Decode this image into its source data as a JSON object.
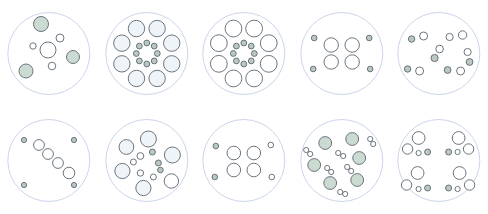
{
  "figure": {
    "rows": 2,
    "columns": 5,
    "background_color": "#ffffff"
  },
  "styles": {
    "enclosure_stroke": "#c5cfe8",
    "enclosure_fill": "#ffffff",
    "enclosure_stroke_width": 0.9,
    "dot_stroke": "#5c6670",
    "dot_stroke_width": 0.9,
    "fill_white": "#ffffff",
    "fill_green": "#ccdbd2",
    "fill_pale_blue": "#eef4f7",
    "fill_gray_green": "#b9c9c2"
  },
  "panels": [
    {
      "id": "panel-1",
      "name": "scattered-mixed-sizes-green-accents",
      "row": 1,
      "column": 1,
      "enclosure": {
        "cx": 48.8,
        "cy": 53.5,
        "r": 41
      },
      "circle_count": 7,
      "circles": [
        {
          "cx": 41,
          "cy": 24,
          "r": 7.5,
          "fill": "green"
        },
        {
          "cx": 26,
          "cy": 71,
          "r": 7.0,
          "fill": "green"
        },
        {
          "cx": 73,
          "cy": 57,
          "r": 6.5,
          "fill": "green"
        },
        {
          "cx": 48,
          "cy": 50,
          "r": 8.0,
          "fill": "white"
        },
        {
          "cx": 60,
          "cy": 38,
          "r": 4.0,
          "fill": "white"
        },
        {
          "cx": 33,
          "cy": 46,
          "r": 3.2,
          "fill": "white"
        },
        {
          "cx": 52,
          "cy": 66,
          "r": 3.8,
          "fill": "white"
        }
      ]
    },
    {
      "id": "panel-2",
      "name": "ebbinghaus-ring-large-outer",
      "row": 1,
      "column": 2,
      "enclosure": {
        "cx": 146.4,
        "cy": 53.5,
        "r": 41
      },
      "circle_count": 16,
      "outer_ring": {
        "count": 8,
        "radius": 27,
        "dot_r": 8.2,
        "fill": "pale_blue"
      },
      "inner_ring": {
        "count": 8,
        "radius": 10.5,
        "dot_r": 2.9,
        "fill": "gray_green"
      }
    },
    {
      "id": "panel-3",
      "name": "ebbinghaus-ring-large-outer-variant",
      "row": 1,
      "column": 3,
      "enclosure": {
        "cx": 244,
        "cy": 53.5,
        "r": 41
      },
      "circle_count": 16,
      "outer_ring": {
        "count": 8,
        "radius": 27,
        "dot_r": 8.4,
        "fill": "white"
      },
      "inner_ring": {
        "count": 8,
        "radius": 10.5,
        "dot_r": 2.9,
        "fill": "gray_green"
      }
    },
    {
      "id": "panel-4",
      "name": "four-medium-cluster-with-corner-dots",
      "row": 1,
      "column": 4,
      "enclosure": {
        "cx": 341.6,
        "cy": 53.5,
        "r": 41
      },
      "circle_count": 8,
      "circles": [
        {
          "cx": 331,
          "cy": 45,
          "r": 7.2,
          "fill": "white"
        },
        {
          "cx": 331,
          "cy": 62,
          "r": 7.2,
          "fill": "white"
        },
        {
          "cx": 352,
          "cy": 45,
          "r": 7.2,
          "fill": "white"
        },
        {
          "cx": 352,
          "cy": 62,
          "r": 7.2,
          "fill": "white"
        },
        {
          "cx": 314,
          "cy": 38,
          "r": 2.8,
          "fill": "gray_green"
        },
        {
          "cx": 313,
          "cy": 69,
          "r": 2.8,
          "fill": "gray_green"
        },
        {
          "cx": 369,
          "cy": 38,
          "r": 2.8,
          "fill": "gray_green"
        },
        {
          "cx": 370,
          "cy": 69,
          "r": 2.8,
          "fill": "gray_green"
        }
      ]
    },
    {
      "id": "panel-5",
      "name": "scattered-small-dots-ring",
      "row": 1,
      "column": 5,
      "enclosure": {
        "cx": 439.2,
        "cy": 53.5,
        "r": 41
      },
      "circle_count": 12,
      "circles": [
        {
          "cx": 412,
          "cy": 39,
          "r": 3.2,
          "fill": "gray_green"
        },
        {
          "cx": 424,
          "cy": 36,
          "r": 4.0,
          "fill": "white"
        },
        {
          "cx": 450,
          "cy": 37,
          "r": 3.6,
          "fill": "white"
        },
        {
          "cx": 463,
          "cy": 35,
          "r": 4.2,
          "fill": "white"
        },
        {
          "cx": 440,
          "cy": 49,
          "r": 3.8,
          "fill": "white"
        },
        {
          "cx": 435,
          "cy": 58,
          "r": 3.6,
          "fill": "gray_green"
        },
        {
          "cx": 468,
          "cy": 52,
          "r": 3.6,
          "fill": "white"
        },
        {
          "cx": 470,
          "cy": 62,
          "r": 3.4,
          "fill": "gray_green"
        },
        {
          "cx": 408,
          "cy": 69,
          "r": 3.2,
          "fill": "gray_green"
        },
        {
          "cx": 420,
          "cy": 71,
          "r": 4.0,
          "fill": "white"
        },
        {
          "cx": 448,
          "cy": 70,
          "r": 3.4,
          "fill": "gray_green"
        },
        {
          "cx": 461,
          "cy": 71,
          "r": 4.0,
          "fill": "white"
        }
      ]
    },
    {
      "id": "panel-6",
      "name": "diagonal-chain-with-corner-dots",
      "row": 2,
      "column": 1,
      "enclosure": {
        "cx": 48.8,
        "cy": 160.5,
        "r": 41
      },
      "circle_count": 8,
      "circles": [
        {
          "cx": 39,
          "cy": 145,
          "r": 5.4,
          "fill": "white"
        },
        {
          "cx": 48,
          "cy": 154,
          "r": 5.4,
          "fill": "white"
        },
        {
          "cx": 58,
          "cy": 163,
          "r": 5.4,
          "fill": "white"
        },
        {
          "cx": 69,
          "cy": 173,
          "r": 5.8,
          "fill": "white"
        },
        {
          "cx": 24,
          "cy": 140,
          "r": 2.6,
          "fill": "gray_green"
        },
        {
          "cx": 74,
          "cy": 140,
          "r": 2.6,
          "fill": "gray_green"
        },
        {
          "cx": 24,
          "cy": 185,
          "r": 2.6,
          "fill": "gray_green"
        },
        {
          "cx": 74,
          "cy": 185,
          "r": 2.6,
          "fill": "gray_green"
        }
      ]
    },
    {
      "id": "panel-7",
      "name": "mixed-large-and-small-scatter",
      "row": 2,
      "column": 2,
      "enclosure": {
        "cx": 146.4,
        "cy": 160.5,
        "r": 41
      },
      "circle_count": 13,
      "circles": [
        {
          "cx": 148,
          "cy": 139,
          "r": 8.0,
          "fill": "pale_blue"
        },
        {
          "cx": 126,
          "cy": 147,
          "r": 7.4,
          "fill": "pale_blue"
        },
        {
          "cx": 172,
          "cy": 155,
          "r": 8.0,
          "fill": "pale_blue"
        },
        {
          "cx": 122,
          "cy": 171,
          "r": 7.6,
          "fill": "pale_blue"
        },
        {
          "cx": 143,
          "cy": 188,
          "r": 7.6,
          "fill": "pale_blue"
        },
        {
          "cx": 171,
          "cy": 181,
          "r": 7.2,
          "fill": "white"
        },
        {
          "cx": 140,
          "cy": 156,
          "r": 3.4,
          "fill": "white"
        },
        {
          "cx": 152,
          "cy": 152,
          "r": 3.0,
          "fill": "gray_green"
        },
        {
          "cx": 158,
          "cy": 163,
          "r": 3.0,
          "fill": "gray_green"
        },
        {
          "cx": 133,
          "cy": 162,
          "r": 3.0,
          "fill": "white"
        },
        {
          "cx": 140,
          "cy": 173,
          "r": 3.2,
          "fill": "white"
        },
        {
          "cx": 153,
          "cy": 177,
          "r": 3.0,
          "fill": "white"
        },
        {
          "cx": 160,
          "cy": 170,
          "r": 2.8,
          "fill": "gray_green"
        }
      ]
    },
    {
      "id": "panel-8",
      "name": "four-medium-cluster-with-corner-dots-variant",
      "row": 2,
      "column": 3,
      "enclosure": {
        "cx": 244,
        "cy": 160.5,
        "r": 41
      },
      "circle_count": 8,
      "circles": [
        {
          "cx": 234,
          "cy": 153,
          "r": 6.8,
          "fill": "white"
        },
        {
          "cx": 234,
          "cy": 170,
          "r": 6.8,
          "fill": "white"
        },
        {
          "cx": 254,
          "cy": 153,
          "r": 6.8,
          "fill": "white"
        },
        {
          "cx": 254,
          "cy": 170,
          "r": 6.8,
          "fill": "white"
        },
        {
          "cx": 216,
          "cy": 146,
          "r": 2.8,
          "fill": "gray_green"
        },
        {
          "cx": 215,
          "cy": 177,
          "r": 2.8,
          "fill": "gray_green"
        },
        {
          "cx": 271,
          "cy": 145,
          "r": 2.8,
          "fill": "white"
        },
        {
          "cx": 272,
          "cy": 177,
          "r": 2.8,
          "fill": "white"
        }
      ]
    },
    {
      "id": "panel-9",
      "name": "green-circles-with-dot-pairs",
      "row": 2,
      "column": 4,
      "enclosure": {
        "cx": 341.6,
        "cy": 160.5,
        "r": 41
      },
      "circle_count": 18,
      "circles": [
        {
          "cx": 325,
          "cy": 143,
          "r": 6.4,
          "fill": "green"
        },
        {
          "cx": 352,
          "cy": 139,
          "r": 6.4,
          "fill": "green"
        },
        {
          "cx": 314,
          "cy": 165,
          "r": 6.4,
          "fill": "green"
        },
        {
          "cx": 359,
          "cy": 158,
          "r": 6.4,
          "fill": "green"
        },
        {
          "cx": 330,
          "cy": 183,
          "r": 6.4,
          "fill": "green"
        },
        {
          "cx": 357,
          "cy": 180,
          "r": 6.4,
          "fill": "green"
        },
        {
          "cx": 370,
          "cy": 139,
          "r": 2.6,
          "fill": "white"
        },
        {
          "cx": 373,
          "cy": 144,
          "r": 2.6,
          "fill": "white"
        },
        {
          "cx": 306,
          "cy": 150,
          "r": 2.6,
          "fill": "white"
        },
        {
          "cx": 310,
          "cy": 154,
          "r": 2.6,
          "fill": "white"
        },
        {
          "cx": 338,
          "cy": 153,
          "r": 2.6,
          "fill": "white"
        },
        {
          "cx": 343,
          "cy": 156,
          "r": 2.6,
          "fill": "white"
        },
        {
          "cx": 327,
          "cy": 168,
          "r": 2.6,
          "fill": "white"
        },
        {
          "cx": 331,
          "cy": 172,
          "r": 2.6,
          "fill": "white"
        },
        {
          "cx": 347,
          "cy": 167,
          "r": 2.6,
          "fill": "white"
        },
        {
          "cx": 351,
          "cy": 171,
          "r": 2.6,
          "fill": "white"
        },
        {
          "cx": 340,
          "cy": 192,
          "r": 2.6,
          "fill": "white"
        },
        {
          "cx": 345,
          "cy": 194,
          "r": 2.6,
          "fill": "white"
        }
      ]
    },
    {
      "id": "panel-10",
      "name": "four-quadrant-large-with-small-dots",
      "row": 2,
      "column": 5,
      "enclosure": {
        "cx": 439.2,
        "cy": 160.5,
        "r": 41
      },
      "circle_count": 16,
      "circles": [
        {
          "cx": 419,
          "cy": 138,
          "r": 6.4,
          "fill": "white"
        },
        {
          "cx": 408,
          "cy": 149,
          "r": 5.2,
          "fill": "white"
        },
        {
          "cx": 419,
          "cy": 153,
          "r": 2.6,
          "fill": "white"
        },
        {
          "cx": 428,
          "cy": 152,
          "r": 3.0,
          "fill": "gray_green"
        },
        {
          "cx": 459,
          "cy": 138,
          "r": 6.4,
          "fill": "white"
        },
        {
          "cx": 469,
          "cy": 149,
          "r": 5.2,
          "fill": "white"
        },
        {
          "cx": 458,
          "cy": 152,
          "r": 2.6,
          "fill": "white"
        },
        {
          "cx": 449,
          "cy": 152,
          "r": 3.0,
          "fill": "gray_green"
        },
        {
          "cx": 418,
          "cy": 173,
          "r": 6.4,
          "fill": "white"
        },
        {
          "cx": 407,
          "cy": 185,
          "r": 5.2,
          "fill": "white"
        },
        {
          "cx": 419,
          "cy": 189,
          "r": 2.6,
          "fill": "white"
        },
        {
          "cx": 428,
          "cy": 188,
          "r": 3.0,
          "fill": "gray_green"
        },
        {
          "cx": 460,
          "cy": 173,
          "r": 6.4,
          "fill": "white"
        },
        {
          "cx": 470,
          "cy": 185,
          "r": 5.2,
          "fill": "white"
        },
        {
          "cx": 458,
          "cy": 189,
          "r": 2.6,
          "fill": "white"
        },
        {
          "cx": 449,
          "cy": 188,
          "r": 3.0,
          "fill": "gray_green"
        }
      ]
    }
  ]
}
